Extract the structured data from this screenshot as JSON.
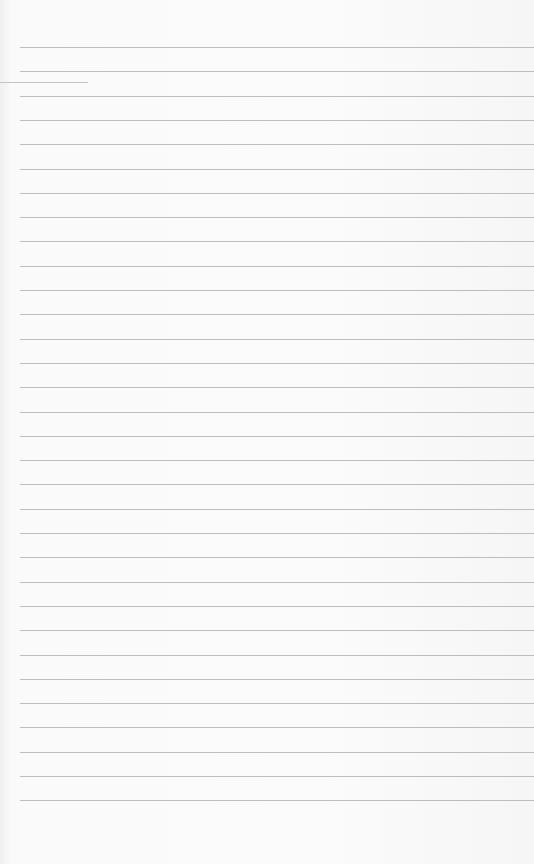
{
  "page": {
    "type": "blank lined paper",
    "line_count": 32,
    "first_line_y": 47,
    "line_spacing": 24.3,
    "line_left": 20,
    "line_color": "#a9a9a9",
    "paper_color": "#fafafa"
  }
}
